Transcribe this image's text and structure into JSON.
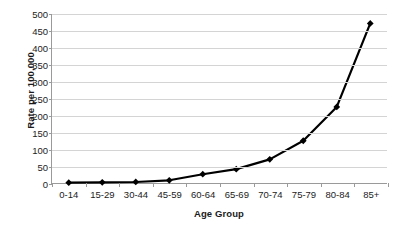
{
  "chart_data": {
    "type": "line",
    "title": "",
    "xlabel": "Age Group",
    "ylabel": "Rate per 100,000",
    "categories": [
      "0-14",
      "15-29",
      "30-44",
      "45-59",
      "60-64",
      "65-69",
      "70-74",
      "75-79",
      "80-84",
      "85+"
    ],
    "values": [
      1,
      2,
      3,
      8,
      26,
      41,
      70,
      125,
      225,
      472
    ],
    "series": [
      {
        "name": "Rate per 100,000",
        "values": [
          1,
          2,
          3,
          8,
          26,
          41,
          70,
          125,
          225,
          472
        ]
      }
    ],
    "ylim": [
      0,
      500
    ],
    "yticks": [
      0,
      50,
      100,
      150,
      200,
      250,
      300,
      350,
      400,
      450,
      500
    ],
    "ytick_labels": [
      "0",
      "50",
      "100",
      "150",
      "200",
      "250",
      "300",
      "350",
      "400",
      "450",
      "500"
    ],
    "grid": true,
    "grid_axis": "y",
    "legend": false,
    "marker": "diamond",
    "line_color": "#000000",
    "marker_color": "#000000",
    "grid_color": "#d4d4d4",
    "axis_color": "#9a9a9a",
    "background_color": "#ffffff"
  }
}
